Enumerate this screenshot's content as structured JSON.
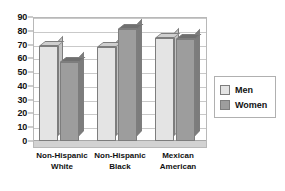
{
  "chart_data": {
    "type": "bar",
    "title": "",
    "subtitle": "",
    "xlabel": "",
    "ylabel": "",
    "ylim": [
      0,
      90
    ],
    "ytick_step": 10,
    "yticks": [
      90,
      80,
      70,
      60,
      50,
      40,
      30,
      20,
      10,
      0
    ],
    "grid": true,
    "legend_position": "right",
    "style": "3d-column",
    "categories": [
      "Non-Hispanic White",
      "Non-Hispanic Black",
      "Mexican American"
    ],
    "category_lines": [
      [
        "Non-Hispanic",
        "White"
      ],
      [
        "Non-Hispanic",
        "Black"
      ],
      [
        "Mexican",
        "American"
      ]
    ],
    "series": [
      {
        "name": "Men",
        "values": [
          69,
          68,
          75
        ],
        "color": "#e4e4e4"
      },
      {
        "name": "Women",
        "values": [
          57,
          81,
          74
        ],
        "color": "#9d9d9d"
      }
    ]
  },
  "legend": {
    "items": [
      {
        "label": "Men"
      },
      {
        "label": "Women"
      }
    ]
  },
  "colors": {
    "men_face": "#e4e4e4",
    "women_face": "#9d9d9d",
    "grid": "#c9c9c9",
    "frame": "#b8b8b8",
    "text": "#111111",
    "background": "#ffffff"
  }
}
